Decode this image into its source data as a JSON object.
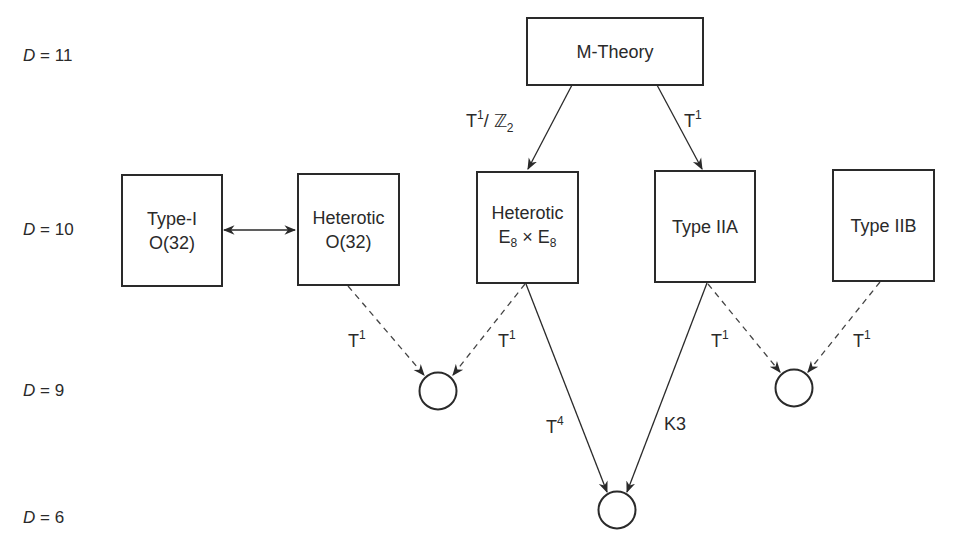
{
  "diagram": {
    "dimension_labels": [
      {
        "var": "D",
        "eq": "=",
        "value": "11"
      },
      {
        "var": "D",
        "eq": "=",
        "value": "10"
      },
      {
        "var": "D",
        "eq": "=",
        "value": "9"
      },
      {
        "var": "D",
        "eq": "=",
        "value": "6"
      }
    ],
    "nodes": {
      "m_theory": {
        "line1": "M-Theory"
      },
      "type_i": {
        "line1": "Type-I",
        "line2": "O(32)"
      },
      "heterotic_o32": {
        "line1": "Heterotic",
        "line2": "O(32)"
      },
      "heterotic_e8": {
        "line1": "Heterotic",
        "e_base": "E",
        "e_sub": "8",
        "times": "×"
      },
      "type_iia": {
        "line1": "Type IIA"
      },
      "type_iib": {
        "line1": "Type IIB"
      }
    },
    "edge_labels": {
      "m_to_het_e8": {
        "base": "T",
        "sup": "1",
        "slash": "/",
        "group": "ℤ",
        "sub": "2"
      },
      "m_to_iia": {
        "base": "T",
        "sup": "1"
      },
      "het_o32_to_c1": {
        "base": "T",
        "sup": "1"
      },
      "het_e8_to_c1": {
        "base": "T",
        "sup": "1"
      },
      "iia_to_c2": {
        "base": "T",
        "sup": "1"
      },
      "iib_to_c2": {
        "base": "T",
        "sup": "1"
      },
      "het_e8_to_c3": {
        "base": "T",
        "sup": "4"
      },
      "iia_to_c3": {
        "base": "K3"
      }
    },
    "colors": {
      "stroke": "#2a2a2a",
      "background": "#ffffff"
    }
  }
}
